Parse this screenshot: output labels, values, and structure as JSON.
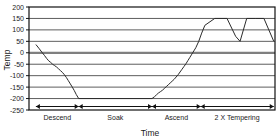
{
  "chart_data": {
    "type": "line",
    "title": "",
    "xlabel": "Time",
    "ylabel": "Temp",
    "ylim": [
      -250,
      200
    ],
    "xlim": [
      0,
      100
    ],
    "grid": true,
    "legend": null,
    "yticks": [
      200,
      150,
      100,
      50,
      0,
      -50,
      -100,
      -150,
      -200,
      -250
    ],
    "ytick_labels": [
      "200",
      "150",
      "100",
      "50",
      "0",
      "-50",
      "-100",
      "-150",
      "-200",
      "-250"
    ],
    "xticks": [],
    "xtick_labels": [],
    "annotations": [
      {
        "label": "Descend",
        "x_start": 2.8,
        "x_end": 20.2,
        "center": 11.5
      },
      {
        "label": "Soak",
        "x_start": 20.2,
        "x_end": 50.0,
        "center": 35.1
      },
      {
        "label": "Ascend",
        "x_start": 50.0,
        "x_end": 69.8,
        "center": 59.9
      },
      {
        "label": "2 X Tempering",
        "x_start": 69.8,
        "x_end": 99.5,
        "center": 84.6
      }
    ],
    "series": [
      {
        "name": "Temp profile",
        "color": "#2b2b2b",
        "x": [
          2.8,
          4.0,
          5.2,
          6.3,
          7.2,
          8.0,
          8.8,
          9.6,
          10.4,
          11.2,
          12.0,
          12.8,
          13.6,
          14.4,
          15.2,
          16.0,
          16.8,
          17.6,
          18.4,
          19.2,
          20.2,
          50.0,
          51.0,
          51.8,
          52.6,
          53.4,
          54.2,
          55.0,
          55.8,
          56.6,
          57.4,
          58.2,
          59.0,
          59.8,
          60.6,
          61.4,
          62.2,
          63.0,
          63.8,
          64.6,
          65.4,
          66.2,
          67.0,
          67.8,
          69.0,
          70.2,
          71.5,
          75.5,
          80.5,
          84.0,
          85.8,
          88.5,
          92.0,
          95.5,
          99.5
        ],
        "y": [
          36,
          20,
          3,
          -12,
          -25,
          -35,
          -42,
          -50,
          -56,
          -62,
          -70,
          -78,
          -86,
          -96,
          -108,
          -122,
          -136,
          -150,
          -165,
          -182,
          -200,
          -200,
          -192,
          -184,
          -176,
          -170,
          -164,
          -156,
          -148,
          -140,
          -132,
          -124,
          -116,
          -106,
          -96,
          -84,
          -72,
          -60,
          -48,
          -34,
          -20,
          -6,
          8,
          22,
          50,
          86,
          120,
          150,
          150,
          72,
          50,
          150,
          150,
          150,
          50
        ]
      }
    ]
  },
  "axis": {
    "y_title": "Temp",
    "x_title": "Time"
  }
}
